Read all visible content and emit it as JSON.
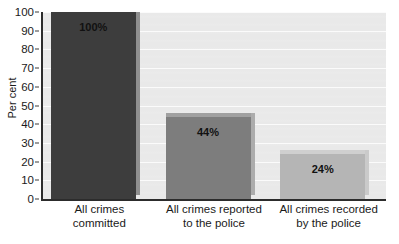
{
  "chart_data": {
    "type": "bar",
    "title": "",
    "subtitle": "",
    "xlabel": "",
    "ylabel": "Per cent",
    "ylim": [
      0,
      100
    ],
    "ytick_step": 10,
    "yticks": [
      100,
      90,
      80,
      70,
      60,
      50,
      40,
      30,
      20,
      10,
      0
    ],
    "ytick_labels": [
      "100",
      "90",
      "80",
      "70",
      "60",
      "50",
      "40",
      "30",
      "20",
      "10",
      "0"
    ],
    "grid": "horizontal",
    "legend": "none",
    "categories": [
      "All crimes committed",
      "All crimes reported to the police",
      "All crimes recorded by the police"
    ],
    "category_lines": [
      [
        "All crimes",
        "committed"
      ],
      [
        "All crimes reported",
        "to the police"
      ],
      [
        "All crimes recorded",
        "by the police"
      ]
    ],
    "values": [
      100,
      44,
      24
    ],
    "data_labels": [
      "100%",
      "44%",
      "24%"
    ],
    "bar_colors": [
      "#3d3d3d",
      "#7d7d7d",
      "#b5b5b5"
    ],
    "bar_top_colors": [
      "#6e6e6e",
      "#a0a0a0",
      "#cfcfcf"
    ],
    "bar_shadow_colors": [
      "#8f8f8f",
      "#acacac",
      "#cacaca"
    ],
    "plot_background": "#e9e9e9",
    "gridline_color": "#fbfbfb",
    "axis_color": "#2c2c2c",
    "page_background": "#ffffff",
    "text_color": "#1a1a1a"
  }
}
